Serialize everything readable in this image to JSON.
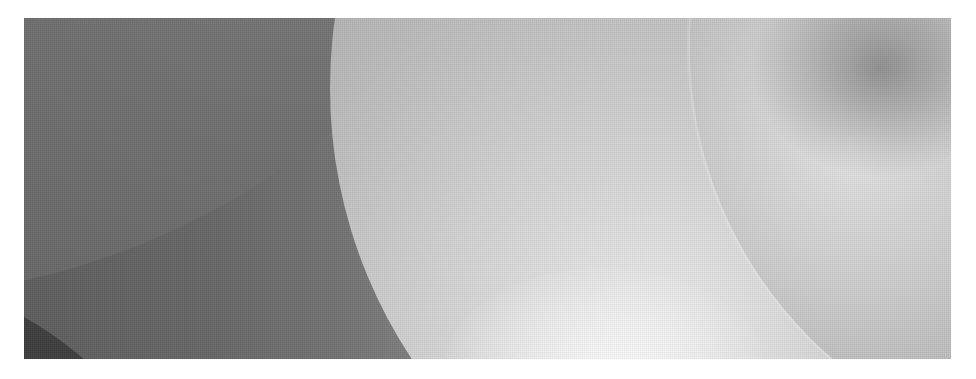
{
  "image": {
    "subject": "abstract grayscale photograph of overlapping curved disc shapes",
    "colors": {
      "background": "#ffffff",
      "dark_lobe": "#3a3a3a",
      "left_field": "#5f5f5f",
      "middle_disk_highlight": "#f4f4f4",
      "right_disk_mid": "#b4b4b4"
    }
  }
}
